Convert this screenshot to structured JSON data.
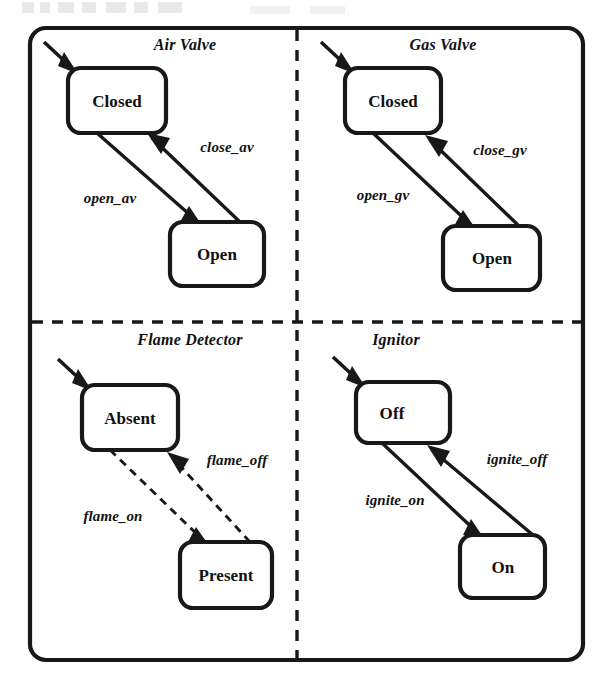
{
  "diagram": {
    "type": "statechart",
    "notation": "UML state machine / orthogonal regions",
    "regions": [
      {
        "id": "air-valve",
        "title": "Air Valve",
        "title_x": 185,
        "title_y": 50,
        "initial_state": "Closed",
        "states": [
          {
            "id": "air-closed",
            "label": "Closed",
            "x": 68,
            "y": 68,
            "w": 98,
            "h": 65
          },
          {
            "id": "air-open",
            "label": "Open",
            "x": 170,
            "y": 222,
            "w": 94,
            "h": 64
          }
        ],
        "transitions": [
          {
            "id": "open-av",
            "label": "open_av",
            "from": "Closed",
            "to": "Open",
            "style": "solid",
            "label_x": 110,
            "label_y": 203
          },
          {
            "id": "close-av",
            "label": "close_av",
            "from": "Open",
            "to": "Closed",
            "style": "solid",
            "label_x": 227,
            "label_y": 152
          }
        ]
      },
      {
        "id": "gas-valve",
        "title": "Gas Valve",
        "title_x": 443,
        "title_y": 50,
        "initial_state": "Closed",
        "states": [
          {
            "id": "gas-closed",
            "label": "Closed",
            "x": 345,
            "y": 68,
            "w": 96,
            "h": 65
          },
          {
            "id": "gas-open",
            "label": "Open",
            "x": 443,
            "y": 226,
            "w": 97,
            "h": 64
          }
        ],
        "transitions": [
          {
            "id": "open-gv",
            "label": "open_gv",
            "from": "Closed",
            "to": "Open",
            "style": "solid",
            "label_x": 383,
            "label_y": 200
          },
          {
            "id": "close-gv",
            "label": "close_gv",
            "from": "Open",
            "to": "Closed",
            "style": "solid",
            "label_x": 500,
            "label_y": 155
          }
        ]
      },
      {
        "id": "flame-detector",
        "title": "Flame Detector",
        "title_x": 190,
        "title_y": 345,
        "initial_state": "Absent",
        "states": [
          {
            "id": "flame-absent",
            "label": "Absent",
            "x": 82,
            "y": 385,
            "w": 96,
            "h": 65
          },
          {
            "id": "flame-present",
            "label": "Present",
            "x": 180,
            "y": 542,
            "w": 92,
            "h": 66
          }
        ],
        "transitions": [
          {
            "id": "flame-on",
            "label": "flame_on",
            "from": "Absent",
            "to": "Present",
            "style": "dashed",
            "label_x": 113,
            "label_y": 521
          },
          {
            "id": "flame-off",
            "label": "flame_off",
            "from": "Present",
            "to": "Absent",
            "style": "dashed",
            "label_x": 237,
            "label_y": 465
          }
        ]
      },
      {
        "id": "ignitor",
        "title": "Ignitor",
        "title_x": 396,
        "title_y": 345,
        "initial_state": "Off",
        "states": [
          {
            "id": "ignitor-off",
            "label": "Off",
            "x": 356,
            "y": 382,
            "w": 94,
            "h": 61
          },
          {
            "id": "ignitor-on",
            "label": "On",
            "x": 460,
            "y": 535,
            "w": 85,
            "h": 63
          }
        ],
        "transitions": [
          {
            "id": "ignite-on",
            "label": "ignite_on",
            "from": "Off",
            "to": "On",
            "style": "solid",
            "label_x": 395,
            "label_y": 505
          },
          {
            "id": "ignite-off",
            "label": "ignite_off",
            "from": "On",
            "to": "Off",
            "style": "solid",
            "label_x": 517,
            "label_y": 464
          }
        ]
      }
    ],
    "frame": {
      "x": 30,
      "y": 28,
      "w": 553,
      "h": 632,
      "rx": 16
    },
    "dividers": {
      "vertical_x": 297,
      "horizontal_y": 322
    },
    "colors": {
      "ink": "#17181a",
      "paper": "#ffffff"
    }
  }
}
